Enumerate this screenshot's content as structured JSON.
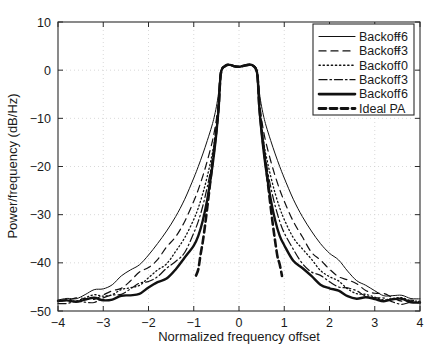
{
  "chart_data": {
    "type": "line",
    "title": "",
    "xlabel": "Normalized frequency offset",
    "ylabel": "Power/frequency (dB/Hz)",
    "xlim": [
      -4,
      4
    ],
    "ylim": [
      -50,
      10
    ],
    "xticks": [
      -4,
      -3,
      -2,
      -1,
      0,
      1,
      2,
      3,
      4
    ],
    "xtick_labels": [
      "−4",
      "−3",
      "−2",
      "−1",
      "0",
      "1",
      "2",
      "3",
      "4"
    ],
    "yticks": [
      -50,
      -40,
      -30,
      -20,
      -10,
      0,
      10
    ],
    "ytick_labels": [
      "−50",
      "−40",
      "−30",
      "−20",
      "−10",
      "0",
      "10"
    ],
    "grid": true,
    "legend_position": "upper right",
    "x": [
      -4.0,
      -3.8,
      -3.6,
      -3.4,
      -3.2,
      -3.0,
      -2.8,
      -2.6,
      -2.4,
      -2.2,
      -2.0,
      -1.8,
      -1.6,
      -1.4,
      -1.2,
      -1.0,
      -0.9,
      -0.8,
      -0.7,
      -0.6,
      -0.55,
      -0.5,
      -0.45,
      -0.4,
      -0.3,
      -0.2,
      -0.1,
      0.0,
      0.1,
      0.2,
      0.3,
      0.4,
      0.45,
      0.5,
      0.55,
      0.6,
      0.7,
      0.8,
      0.9,
      1.0,
      1.2,
      1.4,
      1.6,
      1.8,
      2.0,
      2.2,
      2.4,
      2.6,
      2.8,
      3.0,
      3.2,
      3.4,
      3.6,
      3.8,
      4.0
    ],
    "series": [
      {
        "name": "Backoff −6",
        "style": "solid-thin",
        "stroke_width": 1.0,
        "dash": "none",
        "values": [
          -47.6,
          -47.4,
          -47.1,
          -46.7,
          -46.2,
          -45.6,
          -44.6,
          -43.2,
          -41.6,
          -39.9,
          -38.2,
          -36.0,
          -33.4,
          -30.4,
          -26.8,
          -22.4,
          -20.0,
          -17.4,
          -14.6,
          -11.6,
          -9.8,
          -7.6,
          -4.6,
          -0.2,
          0.9,
          1.1,
          0.8,
          0.7,
          0.9,
          1.1,
          1.0,
          -0.2,
          -4.6,
          -7.6,
          -9.8,
          -11.6,
          -14.6,
          -17.4,
          -20.0,
          -22.4,
          -26.8,
          -30.4,
          -33.4,
          -36.0,
          -38.2,
          -39.9,
          -41.6,
          -43.2,
          -44.6,
          -45.6,
          -46.2,
          -46.7,
          -47.1,
          -47.4,
          -47.6
        ]
      },
      {
        "name": "Backoff −3",
        "style": "dashed",
        "stroke_width": 1.2,
        "dash": "7 5",
        "values": [
          -47.9,
          -47.7,
          -47.5,
          -47.2,
          -46.9,
          -46.5,
          -45.8,
          -44.9,
          -43.8,
          -42.5,
          -41.2,
          -39.4,
          -37.2,
          -34.6,
          -31.4,
          -27.2,
          -24.8,
          -22.0,
          -18.8,
          -15.2,
          -13.0,
          -10.2,
          -6.2,
          -0.4,
          0.9,
          1.1,
          0.8,
          0.7,
          0.9,
          1.1,
          1.0,
          -0.4,
          -6.2,
          -10.2,
          -13.0,
          -15.2,
          -18.8,
          -22.0,
          -24.8,
          -27.2,
          -31.4,
          -34.6,
          -37.2,
          -39.4,
          -41.2,
          -42.5,
          -43.8,
          -44.9,
          -45.8,
          -46.5,
          -46.9,
          -47.2,
          -47.5,
          -47.7,
          -47.9
        ]
      },
      {
        "name": "Backoff  0",
        "style": "dotted",
        "stroke_width": 1.3,
        "dash": "1.2 2.6",
        "values": [
          -48.1,
          -48.0,
          -47.8,
          -47.6,
          -47.3,
          -47.0,
          -46.5,
          -45.8,
          -45.0,
          -44.0,
          -42.9,
          -41.5,
          -39.8,
          -37.6,
          -34.8,
          -31.0,
          -28.6,
          -25.6,
          -22.0,
          -17.8,
          -15.2,
          -11.8,
          -7.2,
          -0.5,
          0.9,
          1.1,
          0.8,
          0.7,
          0.9,
          1.1,
          1.0,
          -0.5,
          -7.2,
          -11.8,
          -15.2,
          -17.8,
          -22.0,
          -25.6,
          -28.6,
          -31.0,
          -34.8,
          -37.6,
          -39.8,
          -41.5,
          -42.9,
          -44.0,
          -45.0,
          -45.8,
          -46.5,
          -47.0,
          -47.3,
          -47.6,
          -47.8,
          -48.0,
          -48.1
        ]
      },
      {
        "name": "Backoff  3",
        "style": "dash-dot",
        "stroke_width": 1.2,
        "dash": "8 3 1.5 3",
        "values": [
          -48.2,
          -48.1,
          -48.0,
          -47.8,
          -47.6,
          -47.3,
          -46.9,
          -46.4,
          -45.7,
          -44.9,
          -44.0,
          -42.8,
          -41.4,
          -39.6,
          -37.2,
          -33.8,
          -31.4,
          -28.2,
          -24.2,
          -19.4,
          -16.4,
          -12.6,
          -7.6,
          -0.6,
          0.9,
          1.1,
          0.8,
          0.7,
          0.9,
          1.1,
          1.0,
          -0.6,
          -7.6,
          -12.6,
          -16.4,
          -19.4,
          -24.2,
          -28.2,
          -31.4,
          -33.8,
          -37.2,
          -39.6,
          -41.4,
          -42.8,
          -44.0,
          -44.9,
          -45.7,
          -46.4,
          -46.9,
          -47.3,
          -47.6,
          -47.8,
          -48.0,
          -48.1,
          -48.2
        ]
      },
      {
        "name": "Backoff  6",
        "style": "solid-thick",
        "stroke_width": 2.4,
        "dash": "none",
        "values": [
          -48.3,
          -48.2,
          -48.1,
          -48.0,
          -47.8,
          -47.6,
          -47.3,
          -46.9,
          -46.4,
          -45.8,
          -45.1,
          -44.2,
          -43.1,
          -41.6,
          -39.6,
          -36.6,
          -34.4,
          -31.2,
          -26.8,
          -20.8,
          -17.2,
          -13.0,
          -7.8,
          -0.6,
          0.9,
          1.1,
          0.8,
          0.7,
          0.9,
          1.1,
          1.0,
          -0.6,
          -7.8,
          -13.0,
          -17.2,
          -20.8,
          -26.8,
          -31.2,
          -34.4,
          -36.6,
          -39.6,
          -41.6,
          -43.1,
          -44.2,
          -45.1,
          -45.8,
          -46.4,
          -46.9,
          -47.3,
          -47.6,
          -47.8,
          -48.0,
          -48.1,
          -48.2,
          -48.3
        ]
      }
    ],
    "ideal_pa": {
      "name": "Ideal PA",
      "style": "dashed-thick",
      "stroke_width": 2.6,
      "dash": "7 4",
      "x": [
        -0.95,
        -0.9,
        -0.85,
        -0.8,
        -0.75,
        -0.7,
        -0.65,
        -0.6,
        -0.55,
        -0.5,
        -0.45,
        -0.4,
        -0.3,
        -0.2,
        -0.1,
        0.0,
        0.1,
        0.2,
        0.3,
        0.4,
        0.45,
        0.5,
        0.55,
        0.6,
        0.65,
        0.7,
        0.75,
        0.8,
        0.85,
        0.9,
        0.95
      ],
      "values": [
        -42.6,
        -41.0,
        -38.6,
        -35.6,
        -32.2,
        -28.4,
        -24.4,
        -20.2,
        -16.4,
        -12.4,
        -7.6,
        -0.6,
        0.9,
        1.1,
        0.8,
        0.7,
        0.9,
        1.1,
        1.0,
        -0.6,
        -7.6,
        -12.4,
        -16.4,
        -20.2,
        -24.4,
        -28.4,
        -32.2,
        -35.6,
        -38.6,
        -41.0,
        -42.6
      ]
    },
    "legend_entries": [
      {
        "label": "Backoff",
        "value": "−6",
        "style": "solid-thin",
        "dash": "none",
        "stroke_width": 1.1
      },
      {
        "label": "Backoff",
        "value": "−3",
        "style": "dashed",
        "dash": "7 5",
        "stroke_width": 1.3
      },
      {
        "label": "Backoff",
        "value": "0",
        "style": "dotted",
        "dash": "1.3 2.8",
        "stroke_width": 1.4
      },
      {
        "label": "Backoff",
        "value": "3",
        "style": "dash-dot",
        "dash": "8 3 1.5 3",
        "stroke_width": 1.3
      },
      {
        "label": "Backoff",
        "value": "6",
        "style": "solid-thick",
        "dash": "none",
        "stroke_width": 2.6
      },
      {
        "label": "Ideal PA",
        "value": "",
        "style": "dashed-thick",
        "dash": "7 4",
        "stroke_width": 2.8
      }
    ]
  },
  "colors": {
    "line": "#111111",
    "axis": "#2b2b2b",
    "grid": "#cfcfcf",
    "background": "#ffffff"
  }
}
